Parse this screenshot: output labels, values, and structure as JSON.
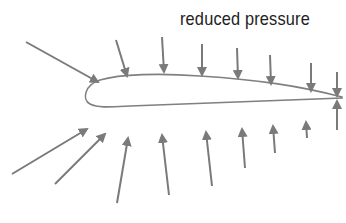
{
  "diagram": {
    "labels": {
      "top": "reduced pressure",
      "bottom": ""
    },
    "colors": {
      "arrow": "#7a7a7a",
      "airfoil_outline": "#808080",
      "text": "#222222",
      "background": "#ffffff"
    },
    "airfoil": {
      "leading_edge": [
        86,
        103
      ],
      "trailing_edge": [
        342,
        97
      ]
    },
    "top_arrows": [
      {
        "from": [
          26,
          42
        ],
        "to": [
          98,
          82
        ]
      },
      {
        "from": [
          116,
          40
        ],
        "to": [
          127,
          76
        ]
      },
      {
        "from": [
          162,
          37
        ],
        "to": [
          164,
          72
        ]
      },
      {
        "from": [
          202,
          44
        ],
        "to": [
          202,
          75
        ]
      },
      {
        "from": [
          237,
          48
        ],
        "to": [
          238,
          78
        ]
      },
      {
        "from": [
          270,
          55
        ],
        "to": [
          271,
          84
        ]
      },
      {
        "from": [
          311,
          63
        ],
        "to": [
          311,
          91
        ]
      },
      {
        "from": [
          337,
          72
        ],
        "to": [
          337,
          96
        ]
      }
    ],
    "bottom_arrows": [
      {
        "from": [
          12,
          174
        ],
        "to": [
          87,
          129
        ]
      },
      {
        "from": [
          55,
          184
        ],
        "to": [
          105,
          134
        ]
      },
      {
        "from": [
          117,
          203
        ],
        "to": [
          128,
          138
        ]
      },
      {
        "from": [
          169,
          195
        ],
        "to": [
          162,
          135
        ]
      },
      {
        "from": [
          212,
          186
        ],
        "to": [
          206,
          132
        ]
      },
      {
        "from": [
          245,
          168
        ],
        "to": [
          242,
          129
        ]
      },
      {
        "from": [
          275,
          153
        ],
        "to": [
          273,
          126
        ]
      },
      {
        "from": [
          307,
          138
        ],
        "to": [
          306,
          122
        ]
      },
      {
        "from": [
          337,
          130
        ],
        "to": [
          337,
          101
        ]
      }
    ]
  }
}
